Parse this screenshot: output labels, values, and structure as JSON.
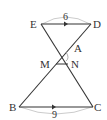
{
  "diagram": {
    "points": {
      "E": {
        "label": "E"
      },
      "D": {
        "label": "D"
      },
      "A": {
        "label": "A"
      },
      "M": {
        "label": "M"
      },
      "N": {
        "label": "N"
      },
      "B": {
        "label": "B"
      },
      "C": {
        "label": "C"
      }
    },
    "lengths": {
      "ED": "6",
      "BC": "9"
    },
    "colors": {
      "line": "#333333",
      "arc": "#cccccc"
    }
  }
}
